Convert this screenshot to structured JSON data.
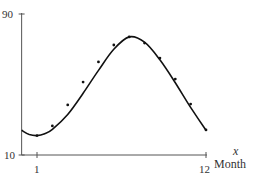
{
  "chart_data": {
    "type": "scatter",
    "title": "",
    "xlabel": "Month",
    "xvar": "x",
    "ylabel": "",
    "xlim": [
      0,
      12
    ],
    "ylim": [
      10,
      90
    ],
    "x_ticks": [
      1,
      12
    ],
    "y_ticks": [
      10,
      90
    ],
    "grid": false,
    "legend": null,
    "series": [
      {
        "name": "data points",
        "kind": "scatter",
        "x": [
          1,
          2,
          3,
          4,
          5,
          6,
          7,
          8,
          9,
          10,
          11,
          12
        ],
        "y": [
          21,
          26.5,
          38.4,
          51.4,
          62.8,
          72.4,
          77.0,
          73.5,
          65.0,
          53.1,
          38.9,
          24.2
        ]
      },
      {
        "name": "fitted curve",
        "kind": "line",
        "x": [
          0,
          0.5,
          1,
          1.5,
          2,
          3,
          4,
          5,
          6,
          7,
          8,
          9,
          10,
          11,
          12
        ],
        "y": [
          24,
          21.6,
          21,
          22,
          24.5,
          33,
          45,
          58,
          70,
          77,
          74,
          64,
          51,
          37,
          24
        ]
      }
    ],
    "colors": {
      "axis": "#555555",
      "curve": "#111111",
      "points": "#111111"
    }
  },
  "labels": {
    "y_top": "90",
    "y_bottom": "10",
    "x_first": "1",
    "x_last": "12",
    "x_var": "x",
    "x_name": "Month"
  }
}
